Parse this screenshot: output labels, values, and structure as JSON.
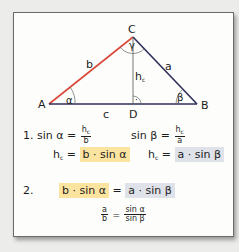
{
  "colors": {
    "side_b": "#d94a3a",
    "side_a": "#2e2e5a",
    "side_c": "#2e2e5a",
    "height": "#444444",
    "highlight_yellow": "#fbe3a0",
    "highlight_gray": "#dfe2e8"
  },
  "triangle": {
    "vertices": {
      "A": "A",
      "B": "B",
      "C": "C",
      "D": "D"
    },
    "sides": {
      "a": "a",
      "b": "b",
      "c": "c"
    },
    "height": {
      "h": "h",
      "sub": "c"
    },
    "angles": {
      "alpha": "α",
      "beta": "β",
      "gamma": "γ"
    },
    "right_angle_mark": "·"
  },
  "step1": {
    "number": "1.",
    "eq_alpha": {
      "lhs": "sin α =",
      "num": "h",
      "num_sub": "c",
      "den": "b"
    },
    "eq_beta": {
      "lhs": "sin β =",
      "num": "h",
      "num_sub": "c",
      "den": "a"
    },
    "hc_alpha": {
      "h": "h",
      "sub": "c",
      "eq": "=",
      "rhs": "b · sin α"
    },
    "hc_beta": {
      "h": "h",
      "sub": "c",
      "eq": "=",
      "rhs": "a · sin β"
    }
  },
  "step2": {
    "number": "2.",
    "lhs": "b · sin α",
    "eq": "=",
    "rhs": "a · sin β",
    "ratio": {
      "num_left": "a",
      "den_left": "b",
      "eq": "=",
      "num_right": "sin α",
      "den_right": "sin β"
    }
  }
}
